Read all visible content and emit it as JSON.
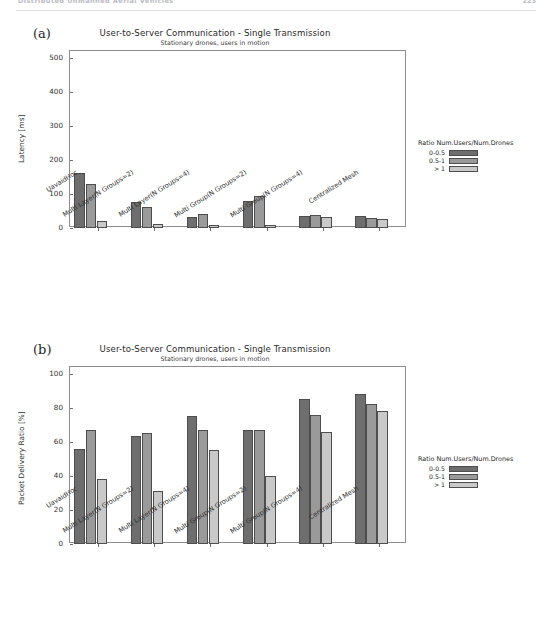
{
  "running_head": {
    "title": "Distributed Unmanned Aerial Vehicles",
    "page_number": "223"
  },
  "colors": {
    "series_0_0_5": "#6e6e6e",
    "series_0_5_1": "#9a9a9a",
    "series_gt_1": "#c9c9c9",
    "axis": "#8d8d8d",
    "text": "#2b2b2b"
  },
  "legend": {
    "title": "Ratio Num.Users/Num.Drones",
    "entries": [
      "0-0.5",
      "0.5-1",
      "> 1"
    ]
  },
  "panels": [
    {
      "letter": "(a)",
      "chart_data": {
        "type": "bar",
        "title": "User-to-Server Communication - Single Transmission",
        "subtitle": "Stationary drones, users in motion",
        "xlabel": "",
        "ylabel": "Latency [ms]",
        "ylim": [
          0,
          520
        ],
        "yticks": [
          0,
          100,
          200,
          300,
          400,
          500
        ],
        "grid": false,
        "legend_position": "right",
        "categories": [
          "UavaidHoc",
          "Multi Layer(N Groups=2)",
          "Multi Layer(N Groups=4)",
          "Multi Group(N Groups=2)",
          "Multi Group(N Groups=4)",
          "Centralized Mesh"
        ],
        "series": [
          {
            "name": "0-0.5",
            "values": [
              162,
              75,
              33,
              80,
              35,
              36
            ]
          },
          {
            "name": "0.5-1",
            "values": [
              130,
              62,
              42,
              95,
              38,
              29
            ]
          },
          {
            "name": "> 1",
            "values": [
              22,
              13,
              9,
              8,
              33,
              27
            ]
          }
        ]
      }
    },
    {
      "letter": "(b)",
      "chart_data": {
        "type": "bar",
        "title": "User-to-Server Communication - Single Transmission",
        "subtitle": "Stationary drones, users in motion",
        "xlabel": "",
        "ylabel": "Packet Delivery Ratio [%]",
        "ylim": [
          0,
          104
        ],
        "yticks": [
          0,
          20,
          40,
          60,
          80,
          100
        ],
        "grid": false,
        "legend_position": "right",
        "categories": [
          "UavaidHoc",
          "Multi Layer(N Groups=2)",
          "Multi Layer(N Groups=4)",
          "Multi Group(N Groups=2)",
          "Multi Group(N Groups=4)",
          "Centralized Mesh"
        ],
        "series": [
          {
            "name": "0-0.5",
            "values": [
              56,
              63.5,
              75,
              67,
              85,
              88
            ]
          },
          {
            "name": "0.5-1",
            "values": [
              67,
              65,
              67,
              67,
              76,
              82
            ]
          },
          {
            "name": "> 1",
            "values": [
              38,
              31,
              55.5,
              40,
              66,
              78
            ]
          }
        ]
      }
    }
  ]
}
